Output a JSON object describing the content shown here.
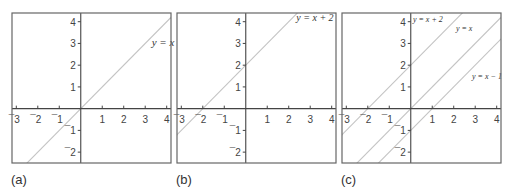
{
  "chart_data": [
    {
      "type": "line",
      "panel": "(a)",
      "xlim": [
        -3.2,
        4.2
      ],
      "ylim": [
        -2.5,
        4.4
      ],
      "xticks": [
        -3,
        -2,
        -1,
        1,
        2,
        3,
        4
      ],
      "yticks": [
        -2,
        -1,
        1,
        2,
        3,
        4
      ],
      "grid": false,
      "series": [
        {
          "name": "y = x",
          "slope": 1,
          "intercept": 0,
          "label_pos": [
            3.3,
            2.9
          ],
          "label_size": 11
        }
      ]
    },
    {
      "type": "line",
      "panel": "(b)",
      "xlim": [
        -3.2,
        4.2
      ],
      "ylim": [
        -2.5,
        4.4
      ],
      "xticks": [
        -3,
        -2,
        -1,
        1,
        2,
        3,
        4
      ],
      "yticks": [
        -2,
        -1,
        1,
        2,
        3,
        4
      ],
      "grid": false,
      "series": [
        {
          "name": "y = x + 2",
          "slope": 1,
          "intercept": 2,
          "label_pos": [
            2.35,
            4.05
          ],
          "label_size": 10
        }
      ]
    },
    {
      "type": "line",
      "panel": "(c)",
      "xlim": [
        -3.2,
        4.2
      ],
      "ylim": [
        -2.5,
        4.4
      ],
      "xticks": [
        -3,
        -2,
        -1,
        1,
        2,
        3,
        4
      ],
      "yticks": [
        -2,
        -1,
        1,
        2,
        3,
        4
      ],
      "grid": false,
      "series": [
        {
          "name": "y = x + 2",
          "slope": 1,
          "intercept": 2,
          "label_pos": [
            0.1,
            4.0
          ],
          "label_size": 8
        },
        {
          "name": "y = x",
          "slope": 1,
          "intercept": 0,
          "label_pos": [
            2.1,
            3.55
          ],
          "label_size": 8
        },
        {
          "name": "y = x − 1",
          "slope": 1,
          "intercept": -1,
          "label_pos": [
            2.85,
            1.35
          ],
          "label_size": 8
        }
      ]
    }
  ],
  "captions": [
    "(a)",
    "(b)",
    "(c)"
  ]
}
